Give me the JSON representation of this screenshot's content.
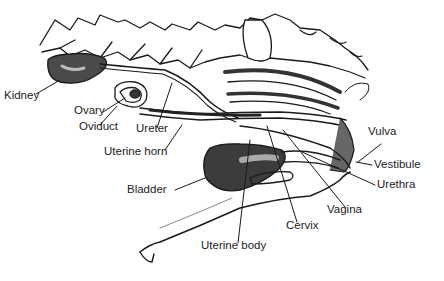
{
  "diagram": {
    "type": "anatomical illustration",
    "colors": {
      "ink": "#1a1a1a",
      "shade": "#555555",
      "background": "#ffffff"
    },
    "labels": [
      {
        "id": "kidney",
        "text": "Kidney",
        "x": 4,
        "y": 96
      },
      {
        "id": "ovary",
        "text": "Ovary",
        "x": 74,
        "y": 111
      },
      {
        "id": "oviduct",
        "text": "Oviduct",
        "x": 79,
        "y": 127
      },
      {
        "id": "ureter",
        "text": "Ureter",
        "x": 136,
        "y": 129
      },
      {
        "id": "uterine-horn",
        "text": "Uterine horn",
        "x": 104,
        "y": 152
      },
      {
        "id": "bladder",
        "text": "Bladder",
        "x": 127,
        "y": 190
      },
      {
        "id": "uterine-body",
        "text": "Uterine body",
        "x": 201,
        "y": 246
      },
      {
        "id": "cervix",
        "text": "Cervix",
        "x": 286,
        "y": 226
      },
      {
        "id": "vagina",
        "text": "Vagina",
        "x": 327,
        "y": 210
      },
      {
        "id": "urethra",
        "text": "Urethra",
        "x": 377,
        "y": 185
      },
      {
        "id": "vestibule",
        "text": "Vestibule",
        "x": 374,
        "y": 165
      },
      {
        "id": "vulva",
        "text": "Vulva",
        "x": 368,
        "y": 132
      }
    ]
  }
}
